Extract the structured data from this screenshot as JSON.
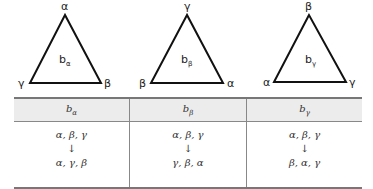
{
  "triangles": [
    {
      "top": "α",
      "left": "γ",
      "right": "β",
      "center_base": "b",
      "center_sub": "α"
    },
    {
      "top": "γ",
      "left": "β",
      "right": "α",
      "center_base": "b",
      "center_sub": "β"
    },
    {
      "top": "β",
      "left": "α",
      "right": "γ",
      "center_base": "b",
      "center_sub": "γ"
    }
  ],
  "table": {
    "headers": [
      {
        "base": "b",
        "sub": "α"
      },
      {
        "base": "b",
        "sub": "β"
      },
      {
        "base": "b",
        "sub": "γ"
      }
    ],
    "rows": [
      {
        "from": "α, β, γ",
        "arrow": "↓",
        "to": "α, γ, β"
      },
      {
        "from": "α, β, γ",
        "arrow": "↓",
        "to": "γ, β, α"
      },
      {
        "from": "α, β, γ",
        "arrow": "↓",
        "to": "β, α, γ"
      }
    ]
  }
}
